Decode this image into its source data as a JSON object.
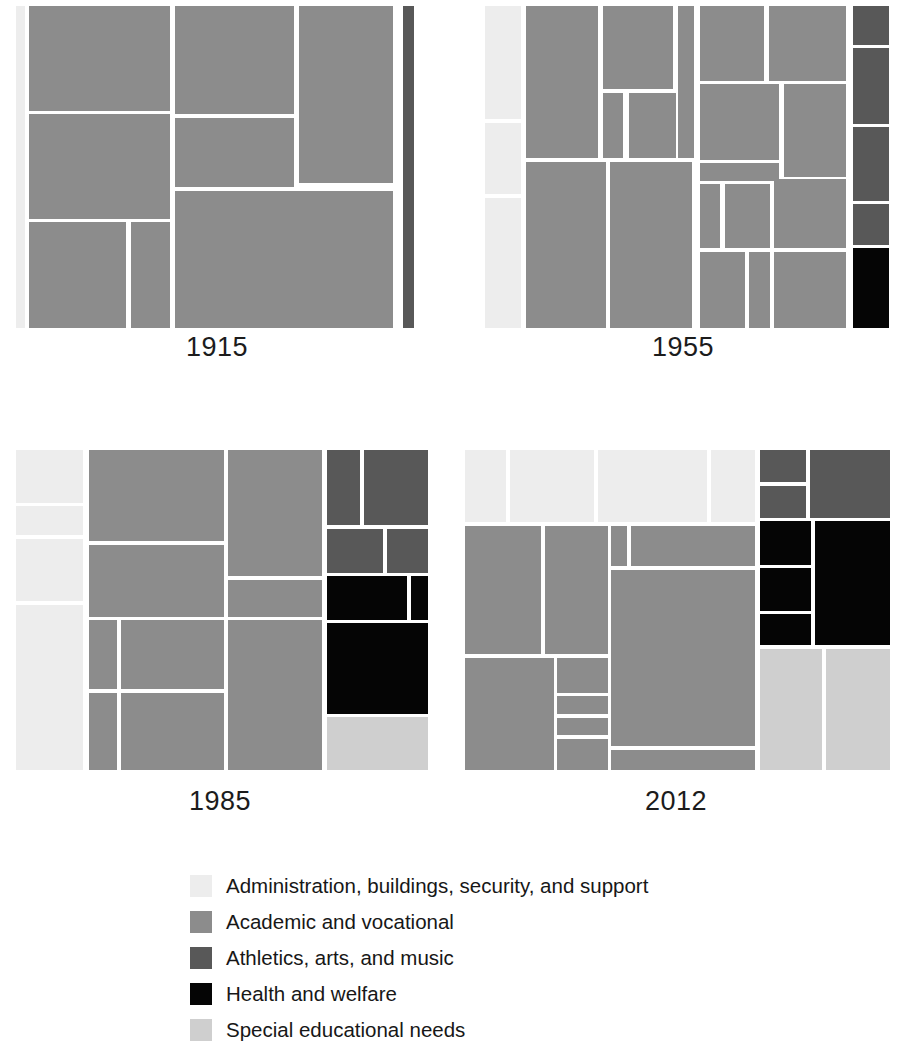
{
  "figure": {
    "background": "#ffffff",
    "gap_color": "#ffffff"
  },
  "categories": [
    {
      "key": "admin",
      "label": "Administration, buildings, security, and support",
      "color": "#ededed"
    },
    {
      "key": "academic",
      "label": "Academic and vocational",
      "color": "#8c8c8c"
    },
    {
      "key": "athletics",
      "label": "Athletics, arts, and music",
      "color": "#585858"
    },
    {
      "key": "health",
      "label": "Health and welfare",
      "color": "#050505"
    },
    {
      "key": "special",
      "label": "Special educational needs",
      "color": "#cfcfcf"
    }
  ],
  "legend": {
    "items": [
      {
        "label": "Administration, buildings, security, and support",
        "color": "#ededed"
      },
      {
        "label": "Academic and vocational",
        "color": "#8c8c8c"
      },
      {
        "label": "Athletics, arts, and music",
        "color": "#585858"
      },
      {
        "label": "Health and welfare",
        "color": "#050505"
      },
      {
        "label": "Special educational needs",
        "color": "#cfcfcf"
      }
    ]
  },
  "chart_data": {
    "type": "treemap",
    "title": "",
    "subtitle": "",
    "xlabel": "",
    "ylabel": "",
    "legend_position": "bottom",
    "grid": false,
    "note": "Four treemaps showing composition of school spending categories by year. Tile rectangles given as percentage of each panel (x, y, w, h).",
    "panels": [
      {
        "year": "1915",
        "label": "1915",
        "totals_pct": {
          "admin": 2.0,
          "academic": 95.5,
          "athletics": 2.5,
          "health": 0.0,
          "special": 0.0
        },
        "tiles": [
          {
            "cat": "admin",
            "x": 1.9,
            "y": 0.0,
            "w": 2.1,
            "h": 100.0
          },
          {
            "cat": "academic",
            "x": 5.0,
            "y": 0.0,
            "w": 33.8,
            "h": 32.5
          },
          {
            "cat": "academic",
            "x": 5.0,
            "y": 33.6,
            "w": 33.8,
            "h": 32.5
          },
          {
            "cat": "academic",
            "x": 5.0,
            "y": 67.2,
            "w": 23.3,
            "h": 32.8
          },
          {
            "cat": "academic",
            "x": 29.4,
            "y": 67.2,
            "w": 9.4,
            "h": 32.8
          },
          {
            "cat": "academic",
            "x": 39.9,
            "y": 0.0,
            "w": 28.6,
            "h": 33.6
          },
          {
            "cat": "academic",
            "x": 39.9,
            "y": 34.7,
            "w": 28.6,
            "h": 21.5
          },
          {
            "cat": "academic",
            "x": 69.6,
            "y": 0.0,
            "w": 22.5,
            "h": 55.0
          },
          {
            "cat": "academic",
            "x": 39.9,
            "y": 57.3,
            "w": 52.2,
            "h": 42.7
          },
          {
            "cat": "athletics",
            "x": 94.6,
            "y": 0.0,
            "w": 2.6,
            "h": 100.0
          }
        ]
      },
      {
        "year": "1955",
        "label": "1955",
        "totals_pct": {
          "admin": 8.5,
          "academic": 79.0,
          "athletics": 8.5,
          "health": 4.0,
          "special": 0.0
        },
        "tiles": [
          {
            "cat": "admin",
            "x": 1.9,
            "y": 0.0,
            "w": 8.7,
            "h": 35.1
          },
          {
            "cat": "admin",
            "x": 1.9,
            "y": 36.2,
            "w": 8.7,
            "h": 22.3
          },
          {
            "cat": "admin",
            "x": 1.9,
            "y": 59.6,
            "w": 8.7,
            "h": 40.4
          },
          {
            "cat": "academic",
            "x": 11.9,
            "y": 0.0,
            "w": 17.4,
            "h": 47.2
          },
          {
            "cat": "academic",
            "x": 30.5,
            "y": 0.0,
            "w": 17.1,
            "h": 25.8
          },
          {
            "cat": "academic",
            "x": 30.5,
            "y": 26.9,
            "w": 5.0,
            "h": 20.3
          },
          {
            "cat": "academic",
            "x": 36.8,
            "y": 26.9,
            "w": 11.4,
            "h": 20.3
          },
          {
            "cat": "academic",
            "x": 48.7,
            "y": 0.0,
            "w": 4.0,
            "h": 47.2
          },
          {
            "cat": "academic",
            "x": 11.9,
            "y": 48.3,
            "w": 19.3,
            "h": 51.7
          },
          {
            "cat": "academic",
            "x": 32.4,
            "y": 48.3,
            "w": 19.9,
            "h": 51.7
          },
          {
            "cat": "academic",
            "x": 54.1,
            "y": 0.0,
            "w": 15.6,
            "h": 23.2
          },
          {
            "cat": "academic",
            "x": 70.8,
            "y": 0.0,
            "w": 18.7,
            "h": 23.2
          },
          {
            "cat": "academic",
            "x": 54.1,
            "y": 24.2,
            "w": 19.2,
            "h": 23.5
          },
          {
            "cat": "academic",
            "x": 74.4,
            "y": 24.2,
            "w": 15.1,
            "h": 28.8
          },
          {
            "cat": "academic",
            "x": 54.1,
            "y": 48.8,
            "w": 19.2,
            "h": 5.5
          },
          {
            "cat": "academic",
            "x": 54.1,
            "y": 55.2,
            "w": 5.0,
            "h": 20.0
          },
          {
            "cat": "academic",
            "x": 60.1,
            "y": 55.2,
            "w": 11.0,
            "h": 20.0
          },
          {
            "cat": "academic",
            "x": 72.2,
            "y": 53.8,
            "w": 17.3,
            "h": 21.4
          },
          {
            "cat": "academic",
            "x": 54.1,
            "y": 76.4,
            "w": 11.0,
            "h": 23.6
          },
          {
            "cat": "academic",
            "x": 66.0,
            "y": 76.4,
            "w": 5.1,
            "h": 23.6
          },
          {
            "cat": "academic",
            "x": 72.2,
            "y": 76.4,
            "w": 17.3,
            "h": 23.6
          },
          {
            "cat": "athletics",
            "x": 91.2,
            "y": 0.0,
            "w": 8.8,
            "h": 12.0
          },
          {
            "cat": "athletics",
            "x": 91.2,
            "y": 13.1,
            "w": 8.8,
            "h": 23.4
          },
          {
            "cat": "athletics",
            "x": 91.2,
            "y": 37.6,
            "w": 8.8,
            "h": 22.9
          },
          {
            "cat": "athletics",
            "x": 91.2,
            "y": 61.6,
            "w": 8.8,
            "h": 12.5
          },
          {
            "cat": "health",
            "x": 91.2,
            "y": 75.2,
            "w": 8.8,
            "h": 24.8
          }
        ]
      },
      {
        "year": "1985",
        "label": "1985",
        "totals_pct": {
          "admin": 12.0,
          "academic": 62.0,
          "athletics": 8.0,
          "health": 13.0,
          "special": 5.0
        },
        "tiles": [
          {
            "cat": "admin",
            "x": 1.0,
            "y": 0.0,
            "w": 16.0,
            "h": 16.5
          },
          {
            "cat": "admin",
            "x": 1.0,
            "y": 17.6,
            "w": 16.0,
            "h": 9.0
          },
          {
            "cat": "admin",
            "x": 1.0,
            "y": 27.7,
            "w": 16.0,
            "h": 19.5
          },
          {
            "cat": "admin",
            "x": 1.0,
            "y": 48.3,
            "w": 16.0,
            "h": 51.7
          },
          {
            "cat": "academic",
            "x": 18.4,
            "y": 0.0,
            "w": 32.5,
            "h": 28.5
          },
          {
            "cat": "academic",
            "x": 18.4,
            "y": 29.6,
            "w": 32.5,
            "h": 22.5
          },
          {
            "cat": "academic",
            "x": 18.4,
            "y": 53.2,
            "w": 6.9,
            "h": 21.5
          },
          {
            "cat": "academic",
            "x": 26.3,
            "y": 53.2,
            "w": 24.6,
            "h": 21.5
          },
          {
            "cat": "academic",
            "x": 18.4,
            "y": 75.8,
            "w": 6.9,
            "h": 24.2
          },
          {
            "cat": "academic",
            "x": 26.3,
            "y": 75.8,
            "w": 24.6,
            "h": 24.2
          },
          {
            "cat": "academic",
            "x": 51.9,
            "y": 0.0,
            "w": 22.7,
            "h": 39.5
          },
          {
            "cat": "academic",
            "x": 51.9,
            "y": 40.6,
            "w": 22.7,
            "h": 11.5
          },
          {
            "cat": "academic",
            "x": 51.9,
            "y": 53.2,
            "w": 22.7,
            "h": 46.8
          },
          {
            "cat": "athletics",
            "x": 75.7,
            "y": 0.0,
            "w": 8.0,
            "h": 23.5
          },
          {
            "cat": "athletics",
            "x": 84.6,
            "y": 0.0,
            "w": 15.4,
            "h": 23.5
          },
          {
            "cat": "athletics",
            "x": 75.7,
            "y": 24.6,
            "w": 13.5,
            "h": 13.8
          },
          {
            "cat": "athletics",
            "x": 90.1,
            "y": 24.6,
            "w": 9.9,
            "h": 13.8
          },
          {
            "cat": "health",
            "x": 75.7,
            "y": 39.5,
            "w": 19.2,
            "h": 13.5
          },
          {
            "cat": "health",
            "x": 95.8,
            "y": 39.5,
            "w": 4.2,
            "h": 13.5
          },
          {
            "cat": "health",
            "x": 75.7,
            "y": 54.0,
            "w": 24.3,
            "h": 28.5
          },
          {
            "cat": "special",
            "x": 75.7,
            "y": 83.5,
            "w": 24.3,
            "h": 16.5
          }
        ]
      },
      {
        "year": "2012",
        "label": "2012",
        "totals_pct": {
          "admin": 21.0,
          "academic": 48.0,
          "athletics": 5.0,
          "health": 15.0,
          "special": 11.0
        },
        "tiles": [
          {
            "cat": "admin",
            "x": 0.8,
            "y": 0.0,
            "w": 9.5,
            "h": 22.5
          },
          {
            "cat": "admin",
            "x": 11.2,
            "y": 0.0,
            "w": 19.6,
            "h": 22.5
          },
          {
            "cat": "admin",
            "x": 31.7,
            "y": 0.0,
            "w": 25.5,
            "h": 22.5
          },
          {
            "cat": "admin",
            "x": 58.2,
            "y": 0.0,
            "w": 10.2,
            "h": 22.5
          },
          {
            "cat": "academic",
            "x": 0.8,
            "y": 23.6,
            "w": 17.7,
            "h": 40.2
          },
          {
            "cat": "academic",
            "x": 19.4,
            "y": 23.6,
            "w": 14.7,
            "h": 40.2
          },
          {
            "cat": "academic",
            "x": 0.8,
            "y": 64.9,
            "w": 20.6,
            "h": 35.1
          },
          {
            "cat": "academic",
            "x": 22.2,
            "y": 64.9,
            "w": 11.9,
            "h": 11.0
          },
          {
            "cat": "academic",
            "x": 22.2,
            "y": 77.0,
            "w": 11.9,
            "h": 5.5
          },
          {
            "cat": "academic",
            "x": 22.2,
            "y": 83.6,
            "w": 11.9,
            "h": 5.5
          },
          {
            "cat": "academic",
            "x": 22.2,
            "y": 90.2,
            "w": 11.9,
            "h": 9.8
          },
          {
            "cat": "academic",
            "x": 34.9,
            "y": 23.6,
            "w": 3.6,
            "h": 12.8
          },
          {
            "cat": "academic",
            "x": 39.4,
            "y": 23.6,
            "w": 29.0,
            "h": 12.8
          },
          {
            "cat": "academic",
            "x": 34.9,
            "y": 37.5,
            "w": 33.5,
            "h": 55.0
          },
          {
            "cat": "academic",
            "x": 34.9,
            "y": 93.6,
            "w": 33.5,
            "h": 6.4
          },
          {
            "cat": "athletics",
            "x": 69.6,
            "y": 0.0,
            "w": 10.8,
            "h": 10.0
          },
          {
            "cat": "athletics",
            "x": 69.6,
            "y": 11.1,
            "w": 10.8,
            "h": 10.0
          },
          {
            "cat": "athletics",
            "x": 81.3,
            "y": 0.0,
            "w": 18.7,
            "h": 21.1
          },
          {
            "cat": "health",
            "x": 69.6,
            "y": 22.3,
            "w": 12.0,
            "h": 13.5
          },
          {
            "cat": "health",
            "x": 69.6,
            "y": 36.8,
            "w": 12.0,
            "h": 13.5
          },
          {
            "cat": "health",
            "x": 69.6,
            "y": 51.2,
            "w": 12.0,
            "h": 9.8
          },
          {
            "cat": "health",
            "x": 82.4,
            "y": 22.3,
            "w": 17.6,
            "h": 38.7
          },
          {
            "cat": "special",
            "x": 69.6,
            "y": 62.1,
            "w": 14.5,
            "h": 37.9
          },
          {
            "cat": "special",
            "x": 85.0,
            "y": 62.1,
            "w": 15.0,
            "h": 37.9
          }
        ]
      }
    ]
  },
  "panel_layout": [
    {
      "left": 8,
      "top": 6,
      "width": 418,
      "height": 322,
      "label_top": 332
    },
    {
      "left": 477,
      "top": 6,
      "width": 412,
      "height": 322,
      "label_top": 332
    },
    {
      "left": 12,
      "top": 450,
      "width": 416,
      "height": 320,
      "label_top": 786
    },
    {
      "left": 462,
      "top": 450,
      "width": 428,
      "height": 320,
      "label_top": 786
    }
  ]
}
